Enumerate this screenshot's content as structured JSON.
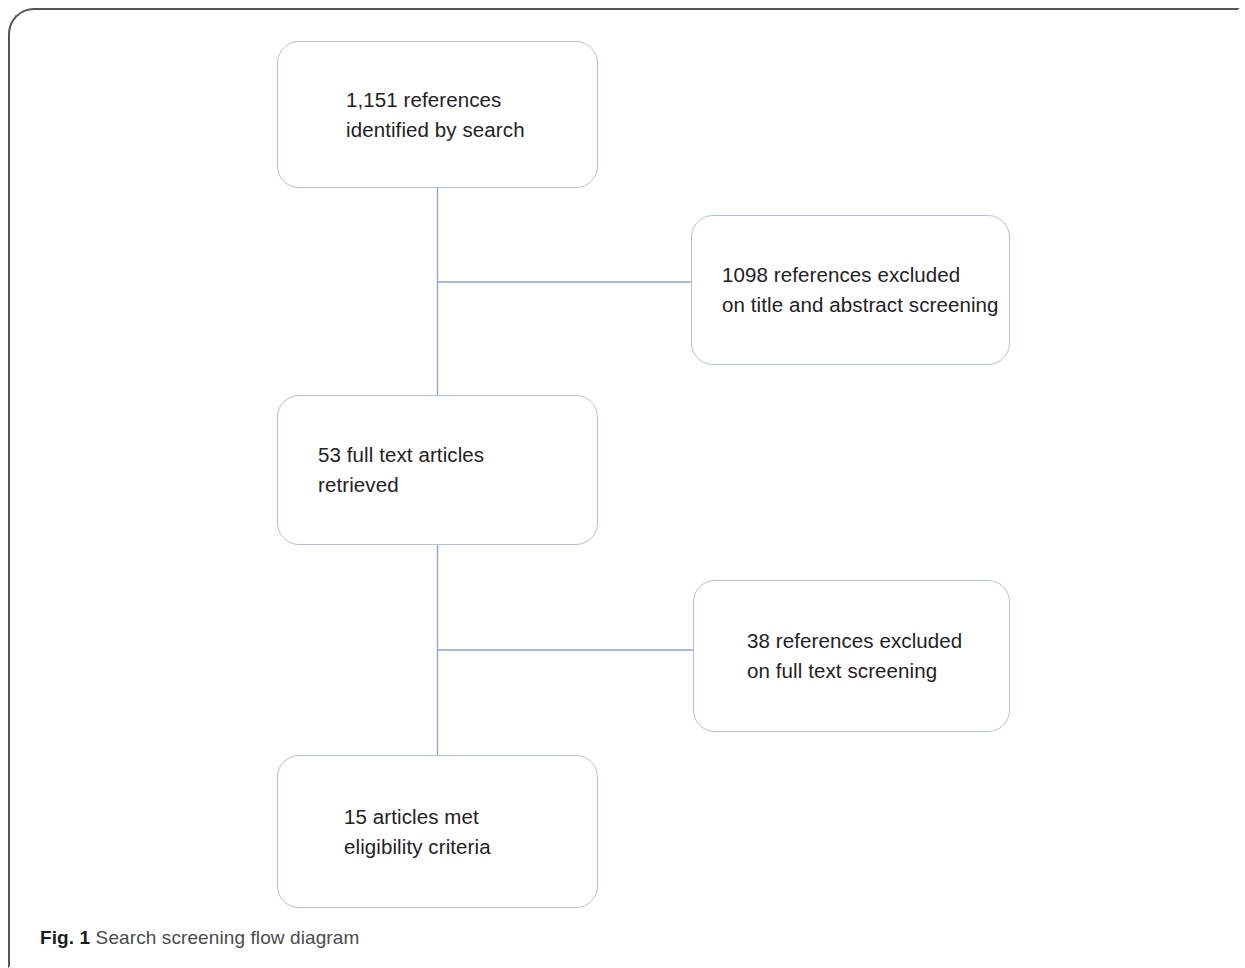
{
  "figure": {
    "caption_label": "Fig. 1",
    "caption_text": "Search screening flow diagram",
    "colors": {
      "box_border": "#b2c2dd",
      "connector": "#8fa6cf",
      "text": "#1f2124",
      "frame": "#55565a",
      "background": "#ffffff"
    }
  },
  "diagram_data": {
    "type": "flowchart",
    "title": "Search screening flow diagram",
    "orientation": "vertical",
    "nodes": [
      {
        "id": "identified",
        "label": "1,151 references\nidentified  by search",
        "count": 1151,
        "stage": "identification",
        "column": "main"
      },
      {
        "id": "excluded_abstract",
        "label": "1098 references excluded\non title and abstract screening",
        "count": 1098,
        "stage": "exclusion",
        "column": "side"
      },
      {
        "id": "fulltext",
        "label": "53 full text articles\nretrieved",
        "count": 53,
        "stage": "screening",
        "column": "main"
      },
      {
        "id": "excluded_fulltext",
        "label": "38 references excluded\non full text screening",
        "count": 38,
        "stage": "exclusion",
        "column": "side"
      },
      {
        "id": "eligible",
        "label": "15 articles met\neligibility criteria",
        "count": 15,
        "stage": "included",
        "column": "main"
      }
    ],
    "edges": [
      {
        "from": "identified",
        "to": "fulltext",
        "kind": "flow"
      },
      {
        "from": "identified",
        "to": "excluded_abstract",
        "kind": "branch"
      },
      {
        "from": "fulltext",
        "to": "eligible",
        "kind": "flow"
      },
      {
        "from": "fulltext",
        "to": "excluded_fulltext",
        "kind": "branch"
      }
    ]
  }
}
